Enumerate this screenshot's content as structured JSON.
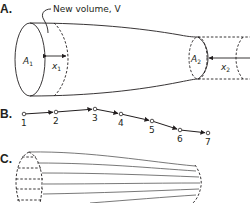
{
  "panel_a": {
    "label": "A.",
    "annotation": "New volume, V",
    "area_1": {
      "symbol": "A",
      "subscript": "1"
    },
    "dist_1": {
      "symbol": "x",
      "subscript": "1"
    },
    "area_2": {
      "symbol": "A",
      "subscript": "2"
    },
    "dist_2": {
      "symbol": "x",
      "subscript": "2"
    }
  },
  "panel_b": {
    "label": "B.",
    "points": [
      {
        "label": "1",
        "x": 24,
        "y": 114
      },
      {
        "label": "2",
        "x": 56,
        "y": 112
      },
      {
        "label": "3",
        "x": 95,
        "y": 109
      },
      {
        "label": "4",
        "x": 121,
        "y": 114
      },
      {
        "label": "5",
        "x": 152,
        "y": 121
      },
      {
        "label": "6",
        "x": 180,
        "y": 130
      },
      {
        "label": "7",
        "x": 208,
        "y": 133
      }
    ]
  },
  "panel_c": {
    "label": "C."
  }
}
